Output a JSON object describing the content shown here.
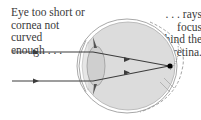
{
  "diagram": {
    "left_caption": [
      "Eye too short or",
      "cornea not curved",
      "enough . . ."
    ],
    "right_caption": [
      ". . . rays focus",
      "behind the",
      "retina."
    ],
    "colors": {
      "eye_fill": "#dcdcdc",
      "outline": "#9a9a9a",
      "rays": "#3c3c3c",
      "text": "#3a3a3a",
      "focus_point": "#000000"
    }
  }
}
